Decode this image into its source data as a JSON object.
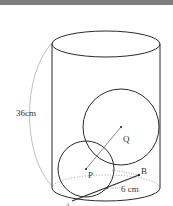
{
  "figure": {
    "type": "geometry-diagram",
    "height_label": "36cm",
    "distance_label": "6 cm",
    "points": {
      "P": "P",
      "Q": "Q",
      "A": "A",
      "B": "B"
    }
  },
  "colors": {
    "topbar": "#7d7d7d",
    "outline": "#2a2a2a",
    "guide": "#b5b5b5",
    "dotted": "#6a6a6a"
  }
}
